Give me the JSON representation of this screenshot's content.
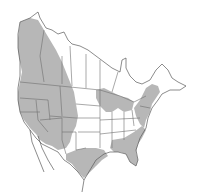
{
  "map": {
    "title": "",
    "region": "North America",
    "type": "species range map",
    "colors": {
      "range_fill": "#b7b7b7",
      "border": "#6e6e6e",
      "coast": "#5a5a5a",
      "background": "#ffffff"
    },
    "range_regions": [
      "western-canada-alaska-panhandle",
      "western-united-states",
      "great-lakes-region",
      "northeastern-united-states",
      "southern-united-states-gulf-coast"
    ]
  }
}
